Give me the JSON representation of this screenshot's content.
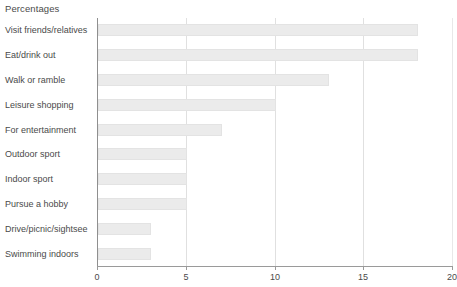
{
  "chart_data": {
    "type": "bar",
    "orientation": "horizontal",
    "title": "Percentages",
    "xlabel": "",
    "ylabel": "",
    "xlim": [
      0,
      20
    ],
    "xticks": [
      0,
      5,
      10,
      15,
      20
    ],
    "xtick_labels": [
      "0",
      "5",
      "10",
      "15",
      "20"
    ],
    "gridlines": [
      5,
      10,
      15
    ],
    "grid": true,
    "legend": null,
    "bar_color": "#ebebeb",
    "bar_border_color": "#e3e3e3",
    "axis_color": "#9a9a9a",
    "grid_color": "#e0e0e0",
    "text_color": "#4a4a4a",
    "categories": [
      "Visit friends/relatives",
      "Eat/drink out",
      "Walk or ramble",
      "Leisure shopping",
      "For entertainment",
      "Outdoor sport",
      "Indoor sport",
      "Pursue a hobby",
      "Drive/picnic/sightsee",
      "Swimming indoors"
    ],
    "values": [
      18,
      18,
      13,
      10,
      7,
      5,
      5,
      5,
      3,
      3
    ]
  }
}
